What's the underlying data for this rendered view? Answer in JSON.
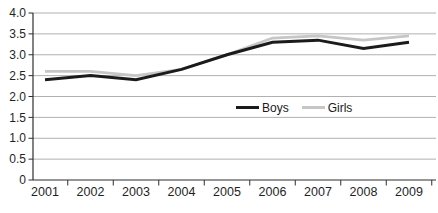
{
  "chart_data": {
    "type": "line",
    "title": "",
    "xlabel": "",
    "ylabel": "",
    "categories": [
      "2001",
      "2002",
      "2003",
      "2004",
      "2005",
      "2006",
      "2007",
      "2008",
      "2009"
    ],
    "series": [
      {
        "name": "Boys",
        "color": "#1b1b1b",
        "stroke_width": 3,
        "values": [
          2.4,
          2.5,
          2.4,
          2.65,
          3.0,
          3.3,
          3.35,
          3.15,
          3.3
        ]
      },
      {
        "name": "Girls",
        "color": "#c6c6c6",
        "stroke_width": 2.8,
        "values": [
          2.6,
          2.6,
          2.5,
          2.65,
          3.0,
          3.4,
          3.45,
          3.35,
          3.45
        ]
      }
    ],
    "ylim": [
      0,
      4
    ],
    "yticks": [
      {
        "value": 0,
        "label": "0"
      },
      {
        "value": 0.5,
        "label": "0.5"
      },
      {
        "value": 1,
        "label": "1.0"
      },
      {
        "value": 1.5,
        "label": "1.5"
      },
      {
        "value": 2,
        "label": "2.0"
      },
      {
        "value": 2.5,
        "label": "2.5"
      },
      {
        "value": 3,
        "label": "3.0"
      },
      {
        "value": 3.5,
        "label": "3.5"
      },
      {
        "value": 4,
        "label": "4.0"
      }
    ],
    "grid": true,
    "legend_position": "inside-middle-right",
    "axis_color": "#2e2e2e",
    "grid_color": "#b0b0b0",
    "text_color": "#1f1f1f"
  }
}
